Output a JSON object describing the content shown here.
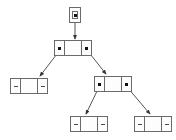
{
  "diagram": {
    "canvas": {
      "width": 176,
      "height": 140
    },
    "colors": {
      "background": "#ffffff",
      "node_border": "#6a6a6a",
      "node_fill": "#fdfdfd",
      "edge": "#555555",
      "pointer_dot": "#111111",
      "null_mark": "#4a4a4a"
    },
    "symbols": {
      "pointer_filled": "filled-square-pointer",
      "pointer_null": "dash-null-pointer"
    },
    "root_handle": {
      "name": "root-pointer-box",
      "x": 69,
      "y": 7,
      "width": 12,
      "height": 16,
      "inner_x": 72,
      "inner_y": 11,
      "inner_width": 6,
      "inner_height": 8,
      "pointer": "pointer_filled",
      "label": ""
    },
    "nodes": [
      {
        "id": "root",
        "name": "tree-node-root",
        "x": 54,
        "y": 40,
        "width": 38,
        "height": 16,
        "left_pointer": "pointer_filled",
        "right_pointer": "pointer_filled",
        "data_label": ""
      },
      {
        "id": "left-child",
        "name": "tree-node-left-child",
        "x": 10,
        "y": 78,
        "width": 38,
        "height": 16,
        "left_pointer": "pointer_null",
        "right_pointer": "pointer_null",
        "data_label": ""
      },
      {
        "id": "right-child",
        "name": "tree-node-right-child",
        "x": 94,
        "y": 76,
        "width": 38,
        "height": 16,
        "left_pointer": "pointer_filled",
        "right_pointer": "pointer_filled",
        "data_label": ""
      },
      {
        "id": "right-left-grandchild",
        "name": "tree-node-right-left-grandchild",
        "x": 70,
        "y": 116,
        "width": 38,
        "height": 16,
        "left_pointer": "pointer_null",
        "right_pointer": "pointer_null",
        "data_label": ""
      },
      {
        "id": "right-right-grandchild",
        "name": "tree-node-right-right-grandchild",
        "x": 134,
        "y": 116,
        "width": 38,
        "height": 16,
        "left_pointer": "pointer_null",
        "right_pointer": "pointer_null",
        "data_label": ""
      }
    ],
    "edges": [
      {
        "name": "edge-root-handle-to-root",
        "from": "root_handle",
        "to": "root",
        "x1": 75,
        "y1": 23,
        "x2": 75,
        "y2": 39
      },
      {
        "name": "edge-root-to-left-child",
        "from": "root",
        "to": "left-child",
        "x1": 60,
        "y1": 50,
        "x2": 40,
        "y2": 76
      },
      {
        "name": "edge-root-to-right-child",
        "from": "root",
        "to": "right-child",
        "x1": 87,
        "y1": 50,
        "x2": 106,
        "y2": 74
      },
      {
        "name": "edge-right-child-to-left-grandchild",
        "from": "right-child",
        "to": "right-left-grandchild",
        "x1": 99,
        "y1": 87,
        "x2": 86,
        "y2": 114
      },
      {
        "name": "edge-right-child-to-right-grandchild",
        "from": "right-child",
        "to": "right-right-grandchild",
        "x1": 127,
        "y1": 87,
        "x2": 150,
        "y2": 114
      }
    ]
  }
}
